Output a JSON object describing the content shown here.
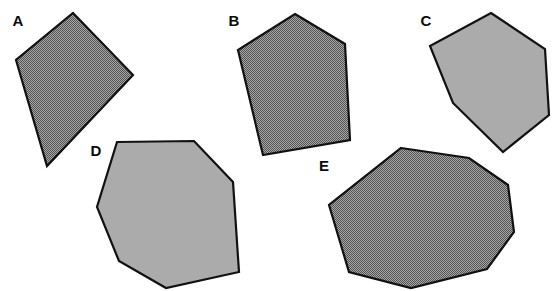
{
  "figure": {
    "background_color": "#ffffff",
    "width": 552,
    "height": 291,
    "outline_color": "#111111",
    "label_color": "#0a0a0a"
  },
  "fills": {
    "dark_halftone": "#7d7d7d",
    "light_solid": "#ababab"
  },
  "shapes": [
    {
      "label": "A",
      "sides": 4,
      "shape_name": "quadrilateral",
      "fill_style": "dark-halftone",
      "fill_color": "#7d7d7d",
      "label_x": 18,
      "label_y": 22,
      "points": "73,13 133,75 47,166 16,60"
    },
    {
      "label": "B",
      "sides": 5,
      "shape_name": "pentagon",
      "fill_style": "dark-halftone",
      "fill_color": "#7d7d7d",
      "label_x": 234,
      "label_y": 22,
      "points": "295,14 345,44 350,140 263,155 238,50"
    },
    {
      "label": "C",
      "sides": 6,
      "shape_name": "hexagon",
      "fill_style": "light-solid",
      "fill_color": "#ababab",
      "label_x": 426,
      "label_y": 22,
      "points": "491,13 545,49 549,115 503,152 453,103 430,46"
    },
    {
      "label": "D",
      "sides": 7,
      "shape_name": "heptagon",
      "fill_style": "light-solid",
      "fill_color": "#ababab",
      "label_x": 96,
      "label_y": 152,
      "points": "117,142 194,141 233,182 239,272 166,288 119,261 97,207"
    },
    {
      "label": "E",
      "sides": 8,
      "shape_name": "octagon",
      "fill_style": "dark-halftone",
      "fill_color": "#7d7d7d",
      "label_x": 324,
      "label_y": 167,
      "points": "401,148 469,158 508,185 514,232 487,269 411,288 349,272 329,205"
    }
  ]
}
